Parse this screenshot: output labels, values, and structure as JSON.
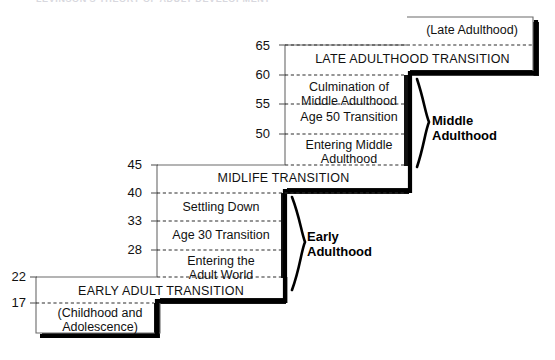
{
  "figure": {
    "cropped_header_text": "LEVINSON'S THEORY OF ADULT DEVELOPMENT",
    "accent_color": "#000000",
    "line_color": "#555555",
    "dash_color": "#333333",
    "background": "#ffffff"
  },
  "axis_ticks": [
    {
      "value": "65",
      "x": 258,
      "y": 41
    },
    {
      "value": "60",
      "x": 258,
      "y": 69
    },
    {
      "value": "55",
      "x": 258,
      "y": 98
    },
    {
      "value": "50",
      "x": 258,
      "y": 128
    },
    {
      "value": "45",
      "x": 130,
      "y": 159
    },
    {
      "value": "40",
      "x": 130,
      "y": 187
    },
    {
      "value": "33",
      "x": 130,
      "y": 215
    },
    {
      "value": "28",
      "x": 130,
      "y": 244
    },
    {
      "value": "22",
      "x": 9,
      "y": 271
    },
    {
      "value": "17",
      "x": 9,
      "y": 297
    }
  ],
  "stage_labels": [
    {
      "name": "late-adulthood",
      "text": "(Late Adulthood)",
      "caps": false,
      "left": 412,
      "top": 22,
      "width": 120,
      "lines": 1
    },
    {
      "name": "late-adulthood-transition",
      "text": "LATE ADULTHOOD TRANSITION",
      "caps": true,
      "left": 290,
      "top": 51,
      "width": 245,
      "lines": 1
    },
    {
      "name": "culmination-of-middle-adulthood",
      "text": "Culmination of\nMiddle Adulthood",
      "caps": false,
      "left": 290,
      "top": 80,
      "width": 118,
      "lines": 2
    },
    {
      "name": "age-50-transition",
      "text": "Age 50 Transition",
      "caps": false,
      "left": 290,
      "top": 110,
      "width": 118,
      "lines": 1
    },
    {
      "name": "entering-middle-adulthood",
      "text": "Entering Middle\nAdulthood",
      "caps": false,
      "left": 290,
      "top": 138,
      "width": 118,
      "lines": 2
    },
    {
      "name": "midlife-transition",
      "text": "MIDLIFE TRANSITION",
      "caps": true,
      "left": 162,
      "top": 170,
      "width": 243,
      "lines": 1
    },
    {
      "name": "settling-down",
      "text": "Settling Down",
      "caps": false,
      "left": 162,
      "top": 199,
      "width": 118,
      "lines": 1
    },
    {
      "name": "age-30-transition",
      "text": "Age 30 Transition",
      "caps": false,
      "left": 162,
      "top": 228,
      "width": 118,
      "lines": 1
    },
    {
      "name": "entering-the-adult-world",
      "text": "Entering the\nAdult World",
      "caps": false,
      "left": 162,
      "top": 254,
      "width": 118,
      "lines": 2
    },
    {
      "name": "early-adult-transition",
      "text": "EARLY ADULT TRANSITION",
      "caps": true,
      "left": 41,
      "top": 284,
      "width": 240,
      "lines": 1
    },
    {
      "name": "childhood-and-adolescence",
      "text": "(Childhood and\nAdolescence)",
      "caps": false,
      "left": 41,
      "top": 306,
      "width": 118,
      "lines": 2
    }
  ],
  "braces": [
    {
      "name": "middle-adulthood",
      "label": "Middle\nAdulthood",
      "label_left": 432,
      "label_top": 112,
      "top": 78,
      "bottom": 168,
      "x": 415
    },
    {
      "name": "early-adulthood",
      "label": "Early\nAdulthood",
      "label_left": 307,
      "label_top": 228,
      "top": 196,
      "bottom": 290,
      "x": 290
    }
  ],
  "steps": [
    {
      "name": "step-late-adulthood",
      "left": 407,
      "top": 17,
      "right": 533,
      "bottom": 45
    },
    {
      "name": "step-late-adulthood-transition",
      "left": 285,
      "top": 45,
      "right": 533,
      "bottom": 75
    },
    {
      "name": "step-middle-adulthood-band",
      "left": 285,
      "top": 75,
      "right": 410,
      "bottom": 165
    },
    {
      "name": "step-midlife-transition",
      "left": 157,
      "top": 165,
      "right": 410,
      "bottom": 193
    },
    {
      "name": "step-early-adulthood-band",
      "left": 157,
      "top": 193,
      "right": 287,
      "bottom": 277
    },
    {
      "name": "step-early-adult-transition",
      "left": 36,
      "top": 277,
      "right": 287,
      "bottom": 303
    },
    {
      "name": "step-childhood",
      "left": 36,
      "top": 303,
      "right": 160,
      "bottom": 336
    }
  ],
  "dashed_lines": [
    {
      "name": "dash-65",
      "x1": 285,
      "x2": 533,
      "y": 45
    },
    {
      "name": "dash-60",
      "x1": 285,
      "x2": 410,
      "y": 75
    },
    {
      "name": "dash-55",
      "x1": 285,
      "x2": 410,
      "y": 104
    },
    {
      "name": "dash-50",
      "x1": 285,
      "x2": 410,
      "y": 134
    },
    {
      "name": "dash-45",
      "x1": 285,
      "x2": 410,
      "y": 165
    },
    {
      "name": "dash-40",
      "x1": 157,
      "x2": 410,
      "y": 193
    },
    {
      "name": "dash-33",
      "x1": 157,
      "x2": 287,
      "y": 221
    },
    {
      "name": "dash-28",
      "x1": 157,
      "x2": 287,
      "y": 250
    },
    {
      "name": "dash-22",
      "x1": 157,
      "x2": 287,
      "y": 277
    },
    {
      "name": "dash-17",
      "x1": 36,
      "x2": 160,
      "y": 303
    }
  ]
}
